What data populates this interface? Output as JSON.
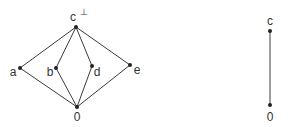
{
  "diagrams": [
    {
      "name": "lattice-left",
      "nodes": [
        {
          "id": "c",
          "label": "c",
          "superscript": "⊥",
          "x": 76,
          "y": 27,
          "lx": 73,
          "ly": 21
        },
        {
          "id": "a",
          "label": "a",
          "x": 20,
          "y": 68,
          "lx": 13,
          "ly": 76
        },
        {
          "id": "b",
          "label": "b",
          "x": 56,
          "y": 68,
          "lx": 50,
          "ly": 76
        },
        {
          "id": "d",
          "label": "d",
          "x": 92,
          "y": 66,
          "lx": 97,
          "ly": 76
        },
        {
          "id": "e",
          "label": "e",
          "x": 130,
          "y": 65,
          "lx": 137,
          "ly": 74
        },
        {
          "id": "0",
          "label": "0",
          "x": 77,
          "y": 107,
          "lx": 77,
          "ly": 121
        }
      ],
      "edges": [
        [
          "c",
          "a"
        ],
        [
          "c",
          "b"
        ],
        [
          "c",
          "d"
        ],
        [
          "c",
          "e"
        ],
        [
          "a",
          "0"
        ],
        [
          "b",
          "0"
        ],
        [
          "d",
          "0"
        ],
        [
          "e",
          "0"
        ]
      ]
    },
    {
      "name": "chain-right",
      "nodes": [
        {
          "id": "c",
          "label": "c",
          "x": 270,
          "y": 31,
          "lx": 270,
          "ly": 25
        },
        {
          "id": "0",
          "label": "0",
          "x": 270,
          "y": 105,
          "lx": 270,
          "ly": 121
        }
      ],
      "edges": [
        [
          "c",
          "0"
        ]
      ]
    }
  ]
}
